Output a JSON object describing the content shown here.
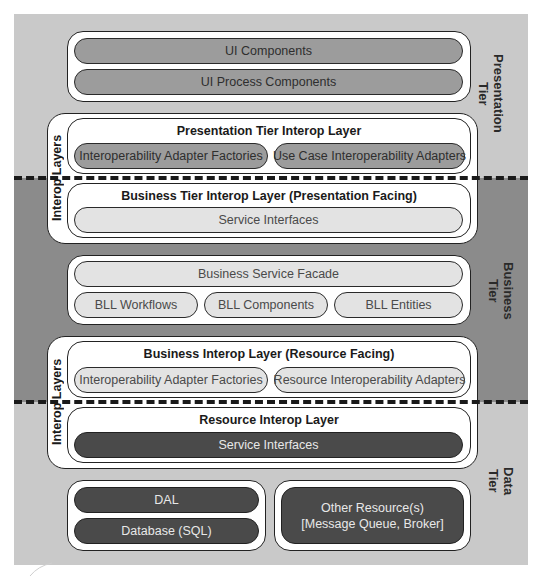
{
  "diagram": {
    "tiers": {
      "presentation": {
        "label_line1": "Presentation",
        "label_line2": "Tier",
        "color": "#c9c9c9"
      },
      "business": {
        "label_line1": "Business",
        "label_line2": "Tier",
        "color": "#8b8b8b"
      },
      "data": {
        "label_line1": "Data",
        "label_line2": "Tier",
        "color": "#c9c9c9"
      }
    },
    "presentation_components": {
      "ui_components": "UI Components",
      "ui_process_components": "UI Process Components"
    },
    "interop_group_1": {
      "label": "Interop Layers",
      "presentation_interop": {
        "title": "Presentation Tier Interop Layer",
        "items": [
          "Interoperability Adapter Factories",
          "Use Case Interoperability Adapters"
        ]
      },
      "business_interop": {
        "title": "Business Tier Interop Layer (Presentation Facing)",
        "items": [
          "Service Interfaces"
        ]
      }
    },
    "business_layer": {
      "facade": "Business Service Facade",
      "items": [
        "BLL Workflows",
        "BLL Components",
        "BLL Entities"
      ]
    },
    "interop_group_2": {
      "label": "Interop Layers",
      "business_interop": {
        "title": "Business Interop Layer (Resource Facing)",
        "items": [
          "Interoperability Adapter Factories",
          "Resource Interoperability Adapters"
        ]
      },
      "resource_interop": {
        "title": "Resource Interop Layer",
        "items": [
          "Service Interfaces"
        ]
      }
    },
    "data_layer": {
      "dal": "DAL",
      "database": "Database (SQL)",
      "other_line1": "Other Resource(s)",
      "other_line2": "[Message Queue, Broker]"
    }
  }
}
